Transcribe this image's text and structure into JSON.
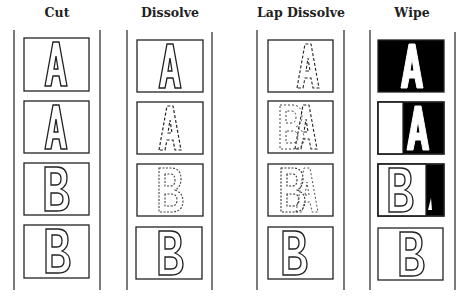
{
  "columns": [
    {
      "title": "Cut",
      "frames": [
        "A",
        "A",
        "B",
        "B"
      ]
    },
    {
      "title": "Dissolve",
      "frames": [
        "A",
        "A (dashed, fading)",
        "B (dashed, appearing)",
        "B"
      ]
    },
    {
      "title": "Lap Dissolve",
      "frames": [
        "A (dashed)",
        "B over A (dashed overlap)",
        "B over A (dashed overlap)",
        "B"
      ]
    },
    {
      "title": "Wipe",
      "frames": [
        "A (white on black)",
        "B wiping in over A",
        "B mostly covering A",
        "B"
      ]
    }
  ],
  "colors": {
    "ink": "#222222",
    "background": "#ffffff",
    "fill_black": "#000000"
  }
}
